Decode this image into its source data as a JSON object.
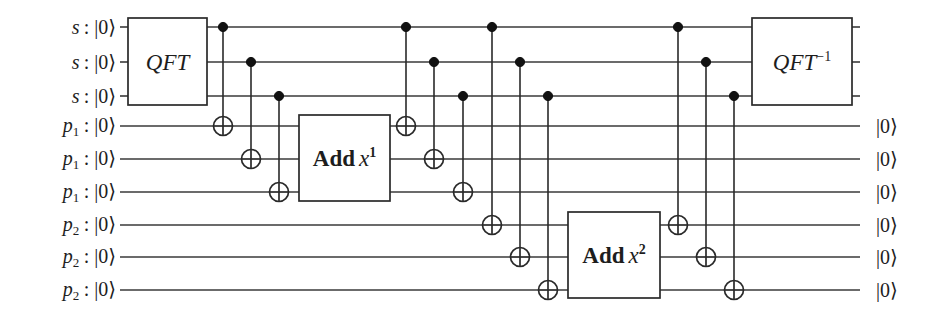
{
  "figure": {
    "kind": "quantum-circuit-diagram",
    "width": 943,
    "height": 316,
    "background_color": "#ffffff",
    "ink_color": "#2a2a2a"
  },
  "wires": [
    {
      "id": "s0",
      "y": 27,
      "input_label": "s",
      "input_sub": "",
      "input_sep": ":",
      "input_ket": "|0⟩",
      "output_ket": ""
    },
    {
      "id": "s1",
      "y": 62,
      "input_label": "s",
      "input_sub": "",
      "input_sep": ":",
      "input_ket": "|0⟩",
      "output_ket": ""
    },
    {
      "id": "s2",
      "y": 96,
      "input_label": "s",
      "input_sub": "",
      "input_sep": ":",
      "input_ket": "|0⟩",
      "output_ket": ""
    },
    {
      "id": "p1a",
      "y": 126,
      "input_label": "p",
      "input_sub": "1",
      "input_sep": ":",
      "input_ket": "|0⟩",
      "output_ket": "|0⟩"
    },
    {
      "id": "p1b",
      "y": 159,
      "input_label": "p",
      "input_sub": "1",
      "input_sep": ":",
      "input_ket": "|0⟩",
      "output_ket": "|0⟩"
    },
    {
      "id": "p1c",
      "y": 192,
      "input_label": "p",
      "input_sub": "1",
      "input_sep": ":",
      "input_ket": "|0⟩",
      "output_ket": "|0⟩"
    },
    {
      "id": "p2a",
      "y": 225,
      "input_label": "p",
      "input_sub": "2",
      "input_sep": ":",
      "input_ket": "|0⟩",
      "output_ket": "|0⟩"
    },
    {
      "id": "p2b",
      "y": 257,
      "input_label": "p",
      "input_sub": "2",
      "input_sep": ":",
      "input_ket": "|0⟩",
      "output_ket": "|0⟩"
    },
    {
      "id": "p2c",
      "y": 290,
      "input_label": "p",
      "input_sub": "2",
      "input_sep": ":",
      "input_ket": "|0⟩",
      "output_ket": "|0⟩"
    }
  ],
  "wire_span": {
    "x_start": 120,
    "x_end": 860
  },
  "label_columns": {
    "input_right_x": 116,
    "output_left_x": 876
  },
  "gates": [
    {
      "name": "qft",
      "text": "QFT",
      "sup": "",
      "style": "italic",
      "x": 128,
      "y": 18,
      "w": 79,
      "h": 87,
      "center_x": 167.5,
      "center_y": 61.5
    },
    {
      "name": "add-x1",
      "text": "Add",
      "var": "x",
      "sup": "1",
      "style": "bold",
      "x": 299,
      "y": 115,
      "w": 91,
      "h": 86,
      "center_x": 344.5,
      "center_y": 158
    },
    {
      "name": "add-x2",
      "text": "Add",
      "var": "x",
      "sup": "2",
      "style": "bold",
      "x": 568,
      "y": 212,
      "w": 92,
      "h": 86,
      "center_x": 614,
      "center_y": 255
    },
    {
      "name": "qft-inverse",
      "text": "QFT",
      "sup": "−1",
      "style": "italic",
      "x": 752,
      "y": 18,
      "w": 100,
      "h": 87,
      "center_x": 802,
      "center_y": 61.5
    }
  ],
  "cnot_groups": [
    {
      "name": "cnot-group-1",
      "description": "s register controls onto p1 register",
      "gates": [
        {
          "x": 223,
          "control_y": 27,
          "target_y": 126
        },
        {
          "x": 251,
          "control_y": 62,
          "target_y": 159
        },
        {
          "x": 279,
          "control_y": 96,
          "target_y": 192
        }
      ]
    },
    {
      "name": "cnot-group-2",
      "description": "s register controls onto p1 register",
      "gates": [
        {
          "x": 406,
          "control_y": 27,
          "target_y": 126
        },
        {
          "x": 434,
          "control_y": 62,
          "target_y": 159
        },
        {
          "x": 463,
          "control_y": 96,
          "target_y": 192
        }
      ]
    },
    {
      "name": "cnot-group-3",
      "description": "s register controls onto p2 register",
      "gates": [
        {
          "x": 492,
          "control_y": 27,
          "target_y": 225
        },
        {
          "x": 520,
          "control_y": 62,
          "target_y": 257
        },
        {
          "x": 548,
          "control_y": 96,
          "target_y": 290
        }
      ]
    },
    {
      "name": "cnot-group-4",
      "description": "s register controls onto p2 register",
      "gates": [
        {
          "x": 678,
          "control_y": 27,
          "target_y": 225
        },
        {
          "x": 706,
          "control_y": 62,
          "target_y": 257
        },
        {
          "x": 734,
          "control_y": 96,
          "target_y": 290
        }
      ]
    }
  ],
  "geometry": {
    "control_radius": 4.6,
    "target_radius": 9.5
  }
}
